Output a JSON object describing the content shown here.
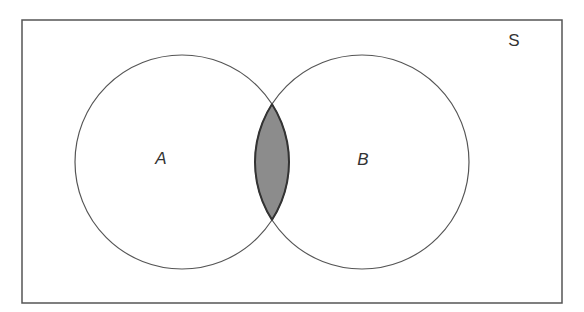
{
  "diagram": {
    "type": "venn",
    "universe": {
      "label": "S",
      "x": 22,
      "y": 20,
      "width": 540,
      "height": 283
    },
    "sets": [
      {
        "label": "A",
        "cx": 182,
        "cy": 162,
        "r": 107
      },
      {
        "label": "B",
        "cx": 362,
        "cy": 162,
        "r": 107
      }
    ],
    "shaded_region": "A ∩ B",
    "colors": {
      "stroke": "#4a4a4a",
      "shade": "#8c8c8c",
      "background": "#ffffff"
    }
  }
}
